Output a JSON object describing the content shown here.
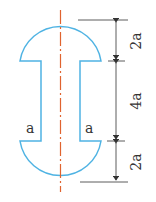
{
  "diagram": {
    "colors": {
      "outline": "#4fb3e3",
      "axis": "#e0632f",
      "dimension": "#333333"
    },
    "labels": {
      "left_web": "a",
      "right_web": "a",
      "dim_top": "2a",
      "dim_middle": "4a",
      "dim_bottom": "2a"
    }
  }
}
